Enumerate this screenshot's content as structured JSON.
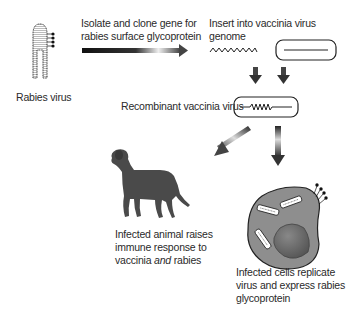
{
  "labels": {
    "rabies_virus": "Rabies virus",
    "step1_line1": "Isolate and clone gene for",
    "step1_line2": "rabies surface glycoprotein",
    "step2": "Insert into vaccinia virus genome",
    "step3": "Recombinant vaccinia virus",
    "animal_line1": "Infected animal raises",
    "animal_line2": "immune response to",
    "animal_line3_a": "vaccinia ",
    "animal_line3_em": "and",
    "animal_line3_b": " rabies",
    "cells_line1": "Infected cells replicate",
    "cells_line2": "virus and express rabies",
    "cells_line3": "glycoprotein"
  },
  "colors": {
    "dark": "#1a1a1a",
    "cell_fill": "#8c8c8c",
    "nucleus": "#6e6e6e",
    "dog": "#4a4a4a"
  },
  "icons": [
    "rabies-virus-icon",
    "gradient-arrow-icon",
    "gene-zigzag-icon",
    "vaccinia-genome-icon",
    "down-arrow-icon",
    "dog-icon",
    "infected-cell-icon"
  ]
}
